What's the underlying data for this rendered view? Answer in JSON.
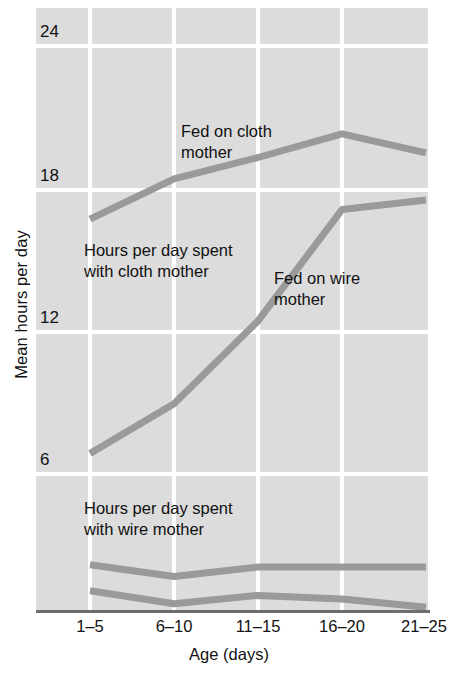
{
  "chart_data": {
    "type": "line",
    "title": "",
    "xlabel": "Age (days)",
    "ylabel": "Mean hours per day",
    "categories": [
      "1–5",
      "6–10",
      "11–15",
      "16–20",
      "21–25"
    ],
    "ylim": [
      0,
      25.5
    ],
    "yticks": [
      6,
      12,
      18,
      24
    ],
    "ytick_labels": [
      "6",
      "12",
      "18",
      "24"
    ],
    "grid": true,
    "legend_position": "inline-annotations",
    "line_color": "#9a9a9a",
    "panel_color": "#dcdcdc",
    "gridline_color": "#ffffff",
    "axis_color": "#6e6e6e",
    "series": [
      {
        "name": "Hours per day spent with cloth mother (fed on cloth mother)",
        "label": "Fed on cloth\nmother",
        "values": [
          16.6,
          18.3,
          19.2,
          20.2,
          19.4
        ]
      },
      {
        "name": "Hours per day spent with cloth mother (fed on wire mother)",
        "label": "Fed on wire\nmother",
        "values": [
          6.7,
          8.8,
          12.3,
          17.0,
          17.4
        ]
      },
      {
        "name": "Hours per day spent with wire mother (fed on wire mother)",
        "label": "Hours per day spent\nwith wire mother",
        "values": [
          2.0,
          1.5,
          1.9,
          1.9,
          1.9
        ]
      },
      {
        "name": "Hours per day spent with wire mother (fed on cloth mother)",
        "label": "",
        "values": [
          0.9,
          0.35,
          0.7,
          0.55,
          0.2
        ]
      }
    ],
    "annotations": [
      {
        "id": "fed-on-cloth-mother",
        "text": "Fed on cloth\nmother"
      },
      {
        "id": "hours-with-cloth-mother",
        "text": "Hours per day spent\nwith cloth mother"
      },
      {
        "id": "fed-on-wire-mother",
        "text": "Fed on wire\nmother"
      },
      {
        "id": "hours-with-wire-mother",
        "text": "Hours per day spent\nwith wire mother"
      }
    ]
  },
  "axes": {
    "y_title": "Mean hours per day",
    "x_title": "Age (days)",
    "y_ticks": [
      "24",
      "18",
      "12",
      "6"
    ],
    "x_ticks": [
      "1–5",
      "6–10",
      "11–15",
      "16–20",
      "21–25"
    ]
  },
  "annotations": {
    "fed_cloth": "Fed on cloth\nmother",
    "cloth_time": "Hours per day spent\nwith cloth mother",
    "fed_wire": "Fed on wire\nmother",
    "wire_time": "Hours per day spent\nwith wire mother"
  }
}
